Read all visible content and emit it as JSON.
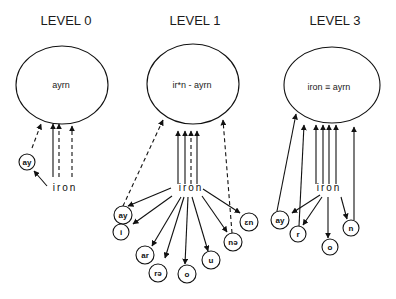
{
  "diagram": {
    "colors": {
      "ink": "#111111",
      "background": "#ffffff"
    },
    "levels": [
      {
        "title": "LEVEL 0",
        "title_pos": [
          66,
          25
        ],
        "ellipse": {
          "cx": 62,
          "cy": 85,
          "rx": 46,
          "ry": 39,
          "label": "ayrn",
          "label_pos": [
            61,
            88
          ]
        },
        "source": {
          "label": "iron",
          "x": 65,
          "y": 191
        },
        "nodes": [
          {
            "label": "ay",
            "cx": 27,
            "cy": 162,
            "r": 8
          }
        ],
        "arrows": [
          {
            "x1": 53,
            "y1": 177,
            "x2": 53,
            "y2": 124,
            "style": "solid"
          },
          {
            "x1": 59,
            "y1": 177,
            "x2": 59,
            "y2": 124,
            "style": "dashed"
          },
          {
            "x1": 72,
            "y1": 177,
            "x2": 72,
            "y2": 126,
            "style": "dashed"
          },
          {
            "x1": 32,
            "y1": 148,
            "x2": 41,
            "y2": 124,
            "style": "dashed"
          },
          {
            "x1": 47,
            "y1": 186,
            "x2": 34,
            "y2": 171,
            "style": "solid"
          }
        ]
      },
      {
        "title": "LEVEL 1",
        "title_pos": [
          195,
          25
        ],
        "ellipse": {
          "cx": 193,
          "cy": 84,
          "rx": 46,
          "ry": 40,
          "label": "ir*n - ayrn",
          "label_pos": [
            192,
            88
          ]
        },
        "source": {
          "label": "iron",
          "x": 191,
          "y": 191
        },
        "nodes": [
          {
            "label": "ay",
            "cx": 123,
            "cy": 215,
            "r": 9
          },
          {
            "label": "i",
            "cx": 121,
            "cy": 232,
            "r": 8
          },
          {
            "label": "ar",
            "cx": 145,
            "cy": 255,
            "r": 9
          },
          {
            "label": "rə",
            "cx": 158,
            "cy": 273,
            "r": 9
          },
          {
            "label": "o",
            "cx": 187,
            "cy": 274,
            "r": 9
          },
          {
            "label": "u",
            "cx": 211,
            "cy": 260,
            "r": 9
          },
          {
            "label": "nə",
            "cx": 233,
            "cy": 242,
            "r": 9
          },
          {
            "label": "ɛn",
            "cx": 249,
            "cy": 222,
            "r": 9
          }
        ],
        "arrows": [
          {
            "x1": 178,
            "y1": 184,
            "x2": 178,
            "y2": 131,
            "style": "solid"
          },
          {
            "x1": 185,
            "y1": 184,
            "x2": 185,
            "y2": 131,
            "style": "solid"
          },
          {
            "x1": 191,
            "y1": 184,
            "x2": 191,
            "y2": 131,
            "style": "dashed"
          },
          {
            "x1": 197,
            "y1": 184,
            "x2": 197,
            "y2": 131,
            "style": "solid"
          },
          {
            "x1": 123,
            "y1": 206,
            "x2": 163,
            "y2": 120,
            "style": "dashed"
          },
          {
            "x1": 232,
            "y1": 233,
            "x2": 223,
            "y2": 120,
            "style": "dashed"
          },
          {
            "x1": 171,
            "y1": 188,
            "x2": 128,
            "y2": 206,
            "style": "solid"
          },
          {
            "x1": 172,
            "y1": 196,
            "x2": 133,
            "y2": 224,
            "style": "solid"
          },
          {
            "x1": 181,
            "y1": 197,
            "x2": 152,
            "y2": 246,
            "style": "solid"
          },
          {
            "x1": 184,
            "y1": 197,
            "x2": 165,
            "y2": 258,
            "style": "solid"
          },
          {
            "x1": 188,
            "y1": 197,
            "x2": 185,
            "y2": 264,
            "style": "solid"
          },
          {
            "x1": 192,
            "y1": 197,
            "x2": 208,
            "y2": 251,
            "style": "solid"
          },
          {
            "x1": 202,
            "y1": 196,
            "x2": 227,
            "y2": 232,
            "style": "solid"
          },
          {
            "x1": 203,
            "y1": 189,
            "x2": 240,
            "y2": 213,
            "style": "solid"
          }
        ]
      },
      {
        "title": "LEVEL 3",
        "title_pos": [
          335,
          25
        ],
        "ellipse": {
          "cx": 332,
          "cy": 85,
          "rx": 48,
          "ry": 38,
          "label": "iron ≡ ayrn",
          "label_pos": [
            329,
            90
          ]
        },
        "source": {
          "label": "iron",
          "x": 329,
          "y": 191
        },
        "nodes": [
          {
            "label": "ay",
            "cx": 280,
            "cy": 220,
            "r": 9
          },
          {
            "label": "r",
            "cx": 298,
            "cy": 234,
            "r": 8
          },
          {
            "label": "o",
            "cx": 330,
            "cy": 247,
            "r": 8
          },
          {
            "label": "n",
            "cx": 351,
            "cy": 228,
            "r": 8
          }
        ],
        "arrows": [
          {
            "x1": 277,
            "y1": 211,
            "x2": 296,
            "y2": 114,
            "style": "solid"
          },
          {
            "x1": 299,
            "y1": 226,
            "x2": 304,
            "y2": 125,
            "style": "solid"
          },
          {
            "x1": 316,
            "y1": 184,
            "x2": 316,
            "y2": 125,
            "style": "solid"
          },
          {
            "x1": 323,
            "y1": 184,
            "x2": 323,
            "y2": 125,
            "style": "solid"
          },
          {
            "x1": 329,
            "y1": 184,
            "x2": 329,
            "y2": 125,
            "style": "solid"
          },
          {
            "x1": 336,
            "y1": 184,
            "x2": 336,
            "y2": 125,
            "style": "solid"
          },
          {
            "x1": 354,
            "y1": 220,
            "x2": 354,
            "y2": 127,
            "style": "solid"
          },
          {
            "x1": 320,
            "y1": 195,
            "x2": 292,
            "y2": 213,
            "style": "solid"
          },
          {
            "x1": 322,
            "y1": 197,
            "x2": 303,
            "y2": 225,
            "style": "solid"
          },
          {
            "x1": 328,
            "y1": 197,
            "x2": 328,
            "y2": 238,
            "style": "solid"
          },
          {
            "x1": 341,
            "y1": 197,
            "x2": 347,
            "y2": 219,
            "style": "solid"
          }
        ]
      }
    ]
  }
}
